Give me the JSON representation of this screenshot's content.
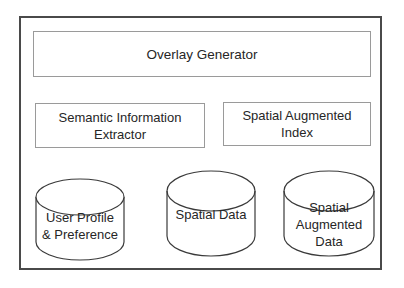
{
  "diagram": {
    "container": {
      "label": ""
    },
    "components": {
      "overlay_generator": "Overlay Generator",
      "semantic_extractor": {
        "line1": "Semantic Information",
        "line2": "Extractor"
      },
      "spatial_augmented_index": {
        "line1": "Spatial Augmented",
        "line2": "Index"
      }
    },
    "datastores": [
      {
        "line1": "User Profile",
        "line2": "& Preference",
        "line3": ""
      },
      {
        "line1": "Spatial Data",
        "line2": "",
        "line3": ""
      },
      {
        "line1": "Spatial",
        "line2": "Augmented",
        "line3": "Data"
      }
    ],
    "colors": {
      "outer_border": "#4a4a4a",
      "box_border": "#9a9a9a",
      "cylinder_stroke": "#3a3a3a",
      "text": "#262626"
    }
  }
}
